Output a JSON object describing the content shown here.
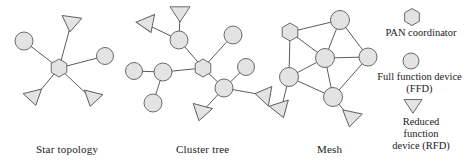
{
  "figure": {
    "background_color": "#ffffff",
    "node_fill": "#e3e3e3",
    "node_stroke": "#5a5a5a",
    "link_stroke": "#4a4a4a"
  },
  "captions": {
    "star": "Star topology",
    "cluster_tree": "Cluster tree",
    "mesh": "Mesh"
  },
  "legend": {
    "pan_coordinator": {
      "icon": "hexagon-icon",
      "label": "PAN coordinator"
    },
    "full_function_device": {
      "icon": "circle-icon",
      "label": "Full function device\n(FFD)"
    },
    "reduced_function_device": {
      "icon": "triangle-icon",
      "label": "Reduced\nfunction\ndevice (RFD)"
    }
  },
  "chart_data": {
    "type": "diagram",
    "node_types": {
      "hexagon": "PAN coordinator",
      "circle": "Full function device (FFD)",
      "triangle": "Reduced function device (RFD)"
    },
    "graphs": [
      {
        "name": "Star topology",
        "caption": "Star topology",
        "nodes": [
          {
            "id": "s0",
            "type": "hexagon",
            "x": 59,
            "y": 68,
            "r": 9
          },
          {
            "id": "s1",
            "type": "circle",
            "x": 24,
            "y": 41,
            "r": 9
          },
          {
            "id": "s2",
            "type": "circle",
            "x": 105,
            "y": 56,
            "r": 8.5
          },
          {
            "id": "s3",
            "type": "triangle",
            "x": 71,
            "y": 24,
            "r": 10,
            "rot": 8
          },
          {
            "id": "s4",
            "type": "triangle",
            "x": 34,
            "y": 98,
            "r": 9.5,
            "rot": -14
          },
          {
            "id": "s5",
            "type": "triangle",
            "x": 92,
            "y": 99,
            "r": 9.5,
            "rot": 14
          }
        ],
        "edges": [
          [
            "s0",
            "s1"
          ],
          [
            "s0",
            "s2"
          ],
          [
            "s0",
            "s3"
          ],
          [
            "s0",
            "s4"
          ],
          [
            "s0",
            "s5"
          ]
        ]
      },
      {
        "name": "Cluster tree",
        "caption": "Cluster tree",
        "nodes": [
          {
            "id": "c0",
            "type": "hexagon",
            "x": 203,
            "y": 68,
            "r": 9
          },
          {
            "id": "c1",
            "type": "circle",
            "x": 179,
            "y": 40,
            "r": 9
          },
          {
            "id": "c2",
            "type": "triangle",
            "x": 180,
            "y": 14,
            "r": 10,
            "rot": 0
          },
          {
            "id": "c3",
            "type": "triangle",
            "x": 148,
            "y": 25,
            "r": 10,
            "rot": -22
          },
          {
            "id": "c4",
            "type": "circle",
            "x": 163,
            "y": 72,
            "r": 9
          },
          {
            "id": "c5",
            "type": "circle",
            "x": 134,
            "y": 71,
            "r": 8.5
          },
          {
            "id": "c6",
            "type": "circle",
            "x": 153,
            "y": 103,
            "r": 9
          },
          {
            "id": "c7",
            "type": "circle",
            "x": 233,
            "y": 35,
            "r": 9
          },
          {
            "id": "c8",
            "type": "circle",
            "x": 224,
            "y": 88,
            "r": 9
          },
          {
            "id": "c9",
            "type": "circle",
            "x": 246,
            "y": 67,
            "r": 8.5
          },
          {
            "id": "c10",
            "type": "triangle",
            "x": 263,
            "y": 95,
            "r": 10,
            "rot": 100
          },
          {
            "id": "c11",
            "type": "triangle",
            "x": 201,
            "y": 113,
            "r": 10,
            "rot": 15
          }
        ],
        "edges": [
          [
            "c0",
            "c1"
          ],
          [
            "c1",
            "c2"
          ],
          [
            "c1",
            "c3"
          ],
          [
            "c0",
            "c4"
          ],
          [
            "c4",
            "c5"
          ],
          [
            "c4",
            "c6"
          ],
          [
            "c0",
            "c7"
          ],
          [
            "c0",
            "c8"
          ],
          [
            "c8",
            "c9"
          ],
          [
            "c8",
            "c10"
          ],
          [
            "c8",
            "c11"
          ]
        ]
      },
      {
        "name": "Mesh",
        "caption": "Mesh",
        "nodes": [
          {
            "id": "m0",
            "type": "hexagon",
            "x": 290,
            "y": 32,
            "r": 9
          },
          {
            "id": "m1",
            "type": "circle",
            "x": 340,
            "y": 20,
            "r": 9.5
          },
          {
            "id": "m2",
            "type": "circle",
            "x": 325,
            "y": 58,
            "r": 9.5
          },
          {
            "id": "m3",
            "type": "circle",
            "x": 368,
            "y": 57,
            "r": 9
          },
          {
            "id": "m4",
            "type": "circle",
            "x": 289,
            "y": 77,
            "r": 9.5
          },
          {
            "id": "m5",
            "type": "circle",
            "x": 333,
            "y": 97,
            "r": 9.5
          },
          {
            "id": "m6",
            "type": "triangle",
            "x": 281,
            "y": 110,
            "r": 10,
            "rot": -18
          },
          {
            "id": "m7",
            "type": "triangle",
            "x": 351,
            "y": 119,
            "r": 10,
            "rot": 12
          }
        ],
        "edges": [
          [
            "m0",
            "m1"
          ],
          [
            "m0",
            "m2"
          ],
          [
            "m0",
            "m4"
          ],
          [
            "m1",
            "m2"
          ],
          [
            "m1",
            "m3"
          ],
          [
            "m2",
            "m3"
          ],
          [
            "m2",
            "m4"
          ],
          [
            "m2",
            "m5"
          ],
          [
            "m3",
            "m5"
          ],
          [
            "m4",
            "m5"
          ],
          [
            "m4",
            "m6"
          ],
          [
            "m5",
            "m7"
          ]
        ]
      }
    ],
    "legend_items": [
      {
        "icon": "hexagon",
        "x": 412,
        "y": 17,
        "r": 8.5,
        "label": "PAN coordinator"
      },
      {
        "icon": "circle",
        "x": 411,
        "y": 61,
        "r": 8,
        "label": "Full function device (FFD)"
      },
      {
        "icon": "triangle",
        "x": 413,
        "y": 106,
        "r": 9,
        "label": "Reduced function device (RFD)"
      }
    ]
  }
}
